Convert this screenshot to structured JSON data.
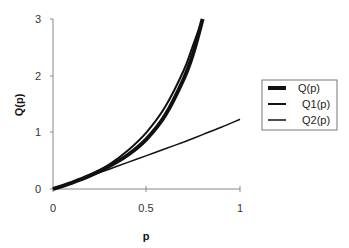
{
  "chart_data": {
    "type": "line",
    "title": "",
    "xlabel": "p",
    "ylabel": "Q(p)",
    "xlim": [
      0,
      1
    ],
    "ylim": [
      0,
      3
    ],
    "x_ticks": [
      "0",
      "0.5",
      "1"
    ],
    "y_ticks": [
      "0",
      "1",
      "2",
      "3"
    ],
    "grid": false,
    "legend_position": "right",
    "series": [
      {
        "name": "Q(p)",
        "style": "thick",
        "x": [
          0,
          0.1,
          0.2,
          0.3,
          0.4,
          0.5,
          0.6,
          0.7,
          0.75,
          0.8
        ],
        "y": [
          0,
          0.11,
          0.24,
          0.4,
          0.6,
          0.88,
          1.3,
          1.95,
          2.4,
          3.0
        ]
      },
      {
        "name": "Q1(p)",
        "style": "medium",
        "x": [
          0,
          0.1,
          0.2,
          0.3,
          0.4,
          0.5,
          0.6,
          0.7,
          0.75,
          0.8
        ],
        "y": [
          0,
          0.11,
          0.25,
          0.43,
          0.68,
          1.0,
          1.45,
          2.1,
          2.55,
          3.0
        ]
      },
      {
        "name": "Q2(p)",
        "style": "thin",
        "x": [
          0,
          0.1,
          0.2,
          0.3,
          0.4,
          0.5,
          0.6,
          0.7,
          0.8,
          0.9,
          1.0
        ],
        "y": [
          0,
          0.11,
          0.23,
          0.35,
          0.47,
          0.59,
          0.71,
          0.83,
          0.96,
          1.09,
          1.23
        ]
      }
    ]
  },
  "axes": {
    "x_title": "p",
    "y_title": "Q(p)",
    "x_tick_labels": [
      "0",
      "0.5",
      "1"
    ],
    "y_tick_labels": [
      "0",
      "1",
      "2",
      "3"
    ]
  },
  "legend": {
    "items": [
      {
        "label": "Q(p)"
      },
      {
        "label": "Q1(p)"
      },
      {
        "label": "Q2(p)"
      }
    ]
  },
  "colors": {
    "line": "#111111",
    "axis": "#888888",
    "legend_border": "#777777"
  }
}
